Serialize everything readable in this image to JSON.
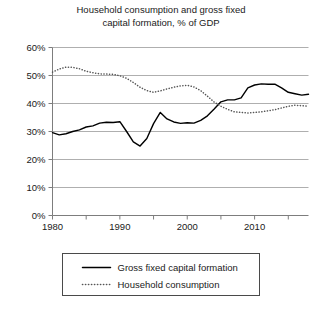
{
  "chart_data": {
    "type": "line",
    "title": "Household consumption and gross fixed\ncapital formation, % of GDP",
    "xlabel": "",
    "ylabel": "",
    "xlim": [
      1980,
      2018
    ],
    "ylim": [
      0,
      60
    ],
    "yticks": [
      0,
      10,
      20,
      30,
      40,
      50,
      60
    ],
    "ytick_labels": [
      "0%",
      "10%",
      "20%",
      "30%",
      "40%",
      "50%",
      "60%"
    ],
    "xticks": [
      1980,
      1990,
      2000,
      2010
    ],
    "xtick_labels": [
      "1980",
      "1990",
      "2000",
      "2010"
    ],
    "x_minor_ticks": [
      1985,
      1995,
      2005,
      2015
    ],
    "grid": "horizontal",
    "legend_position": "below-plot",
    "x": [
      1980,
      1981,
      1982,
      1983,
      1984,
      1985,
      1986,
      1987,
      1988,
      1989,
      1990,
      1991,
      1992,
      1993,
      1994,
      1995,
      1996,
      1997,
      1998,
      1999,
      2000,
      2001,
      2002,
      2003,
      2004,
      2005,
      2006,
      2007,
      2008,
      2009,
      2010,
      2011,
      2012,
      2013,
      2014,
      2015,
      2016,
      2017,
      2018
    ],
    "series": [
      {
        "name": "Gross fixed capital formation",
        "style": "solid",
        "color": "#000000",
        "values": [
          29.6,
          28.8,
          29.2,
          30.0,
          30.6,
          31.6,
          32.0,
          33.0,
          33.3,
          33.2,
          33.5,
          30.0,
          26.3,
          24.8,
          27.5,
          32.8,
          36.8,
          34.5,
          33.4,
          32.9,
          33.1,
          33.0,
          34.0,
          35.6,
          38.0,
          40.6,
          41.3,
          41.3,
          42.0,
          45.6,
          46.6,
          47.0,
          46.9,
          46.9,
          45.6,
          44.0,
          43.5,
          43.0,
          43.3
        ]
      },
      {
        "name": "Household consumption",
        "style": "dotted",
        "color": "#555555",
        "values": [
          51.2,
          52.3,
          53.0,
          52.9,
          52.4,
          51.5,
          51.0,
          50.6,
          50.5,
          50.4,
          49.9,
          49.0,
          47.5,
          45.8,
          44.6,
          44.0,
          44.5,
          45.2,
          45.8,
          46.3,
          46.5,
          45.9,
          44.6,
          42.6,
          40.5,
          39.0,
          37.9,
          37.0,
          36.8,
          36.6,
          36.8,
          37.0,
          37.4,
          37.8,
          38.4,
          39.0,
          39.4,
          39.2,
          39.0
        ]
      }
    ]
  },
  "legend": {
    "items": [
      {
        "label": "Gross fixed capital formation",
        "style": "solid"
      },
      {
        "label": "Household consumption",
        "style": "dotted"
      }
    ]
  }
}
